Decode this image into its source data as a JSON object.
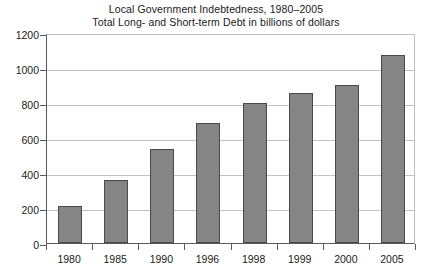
{
  "chart_data": {
    "type": "bar",
    "title": "Local Government Indebtedness, 1980–2005",
    "subtitle": "Total Long- and Short-term Debt in billions of dollars",
    "xlabel": "",
    "ylabel": "",
    "categories": [
      "1980",
      "1985",
      "1990",
      "1996",
      "1998",
      "1999",
      "2000",
      "2005"
    ],
    "values": [
      210,
      360,
      540,
      685,
      800,
      860,
      905,
      1075
    ],
    "ylim": [
      0,
      1200
    ],
    "yticks": [
      0,
      200,
      400,
      600,
      800,
      1000,
      1200
    ],
    "ytick_labels": [
      "0",
      "200",
      "400",
      "600",
      "800",
      "1000",
      "1200"
    ],
    "grid": true,
    "legend": "none",
    "series": [
      {
        "name": "Total Long- and Short-term Debt",
        "values": [
          210,
          360,
          540,
          685,
          800,
          860,
          905,
          1075
        ]
      }
    ],
    "colors": {
      "bar_fill": "#858585",
      "bar_border": "#4a4a4a",
      "gridline": "#c3c3c3",
      "axis": "#5a5a5a",
      "text": "#1a1a1a",
      "background": "#ffffff"
    }
  }
}
